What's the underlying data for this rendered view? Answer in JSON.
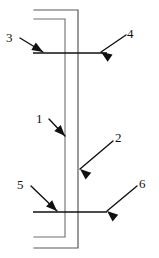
{
  "figure": {
    "kind": "engineering-cross-section-diagram",
    "background_color": "#ffffff",
    "width": 159,
    "height": 258
  },
  "colors": {
    "profile_stroke": "#6e6e6e",
    "profile_stroke_dark": "#58585a",
    "flange_stroke": "#111111",
    "leader_stroke": "#111111",
    "arrow_fill": "#111111",
    "label_color": "#111111",
    "background": "#ffffff"
  },
  "callouts": [
    {
      "id": "callout-1",
      "label": "1",
      "label_x": 36,
      "label_y": 112,
      "leader": {
        "x1": 49,
        "y1": 119,
        "x2": 65,
        "y2": 136
      },
      "arrow_angle_deg": 47,
      "points_to": "inner-web-line"
    },
    {
      "id": "callout-2",
      "label": "2",
      "label_x": 115,
      "label_y": 131,
      "leader": {
        "x1": 113,
        "y1": 141,
        "x2": 80,
        "y2": 169
      },
      "arrow_angle_deg": 220,
      "points_to": "outer-web-line"
    },
    {
      "id": "callout-3",
      "label": "3",
      "label_x": 6,
      "label_y": 31,
      "leader": {
        "x1": 20,
        "y1": 38,
        "x2": 43,
        "y2": 52
      },
      "arrow_angle_deg": 31,
      "points_to": "top-flange-line"
    },
    {
      "id": "callout-4",
      "label": "4",
      "label_x": 127,
      "label_y": 27,
      "leader": {
        "x1": 126,
        "y1": 35,
        "x2": 101,
        "y2": 52
      },
      "arrow_angle_deg": 214,
      "points_to": "top-flange-line"
    },
    {
      "id": "callout-5",
      "label": "5",
      "label_x": 17,
      "label_y": 178,
      "leader": {
        "x1": 31,
        "y1": 186,
        "x2": 57,
        "y2": 211
      },
      "arrow_angle_deg": 44,
      "points_to": "bottom-flange-line"
    },
    {
      "id": "callout-6",
      "label": "6",
      "label_x": 139,
      "label_y": 177,
      "leader": {
        "x1": 137,
        "y1": 186,
        "x2": 107,
        "y2": 211
      },
      "arrow_angle_deg": 220,
      "points_to": "bottom-flange-line"
    }
  ],
  "geometry": {
    "outer_profile_path": "M 34 10 L 78 10 L 78 248 L 34 248",
    "inner_profile_path": "M 34 19 L 65 19 L 65 237 L 34 237",
    "top_flange_path": "M 33 53 L 107 53",
    "bottom_flange_path": "M 33 212 L 107 212"
  }
}
